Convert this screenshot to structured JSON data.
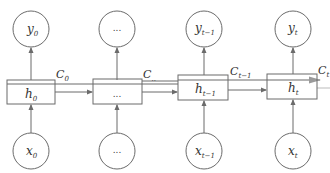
{
  "diagram": {
    "type": "unrolled-lstm",
    "colors": {
      "stroke": "#6b6b6b",
      "text": "#333333",
      "background": "#ffffff"
    },
    "columns": [
      {
        "output": {
          "base": "y",
          "sub": "0"
        },
        "hidden": {
          "base": "h",
          "sub": "0"
        },
        "input": {
          "base": "x",
          "sub": "0"
        },
        "cell": {
          "base": "C",
          "sub": "0"
        }
      },
      {
        "output": {
          "base": "...",
          "sub": ""
        },
        "hidden": {
          "base": "...",
          "sub": ""
        },
        "input": {
          "base": "...",
          "sub": ""
        },
        "cell": {
          "base": "C",
          "sub": ".."
        }
      },
      {
        "output": {
          "base": "y",
          "sub": "t−1"
        },
        "hidden": {
          "base": "h",
          "sub": "t−1"
        },
        "input": {
          "base": "x",
          "sub": "t−1"
        },
        "cell": {
          "base": "C",
          "sub": "t−1"
        }
      },
      {
        "output": {
          "base": "y",
          "sub": "t"
        },
        "hidden": {
          "base": "h",
          "sub": "t"
        },
        "input": {
          "base": "x",
          "sub": "t"
        },
        "cell": {
          "base": "C",
          "sub": "t"
        }
      }
    ]
  }
}
